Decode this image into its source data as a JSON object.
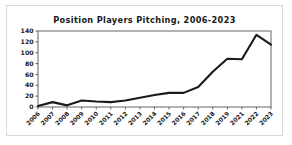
{
  "chart_data": {
    "type": "line",
    "title": "Position Players Pitching, 2006-2023",
    "xlabel": "",
    "ylabel": "",
    "categories": [
      "2006",
      "2007",
      "2008",
      "2009",
      "2010",
      "2011",
      "2012",
      "2013",
      "2014",
      "2015",
      "2016",
      "2017",
      "2018",
      "2019",
      "2021",
      "2022",
      "2023"
    ],
    "values": [
      2,
      9,
      3,
      12,
      10,
      9,
      12,
      17,
      22,
      26,
      26,
      37,
      65,
      89,
      88,
      133,
      115
    ],
    "series": [
      {
        "name": "Position Players Pitching",
        "values": [
          2,
          9,
          3,
          12,
          10,
          9,
          12,
          17,
          22,
          26,
          26,
          37,
          65,
          89,
          88,
          133,
          115
        ]
      }
    ],
    "ylim": [
      0,
      140
    ],
    "yticks": [
      0,
      20,
      40,
      60,
      80,
      100,
      120,
      140
    ],
    "ytick_labels": [
      "0",
      "20",
      "40",
      "60",
      "80",
      "100",
      "120",
      "140"
    ],
    "xtick_labels": [
      "2006",
      "2007",
      "2008",
      "2009",
      "2010",
      "2011",
      "2012",
      "2013",
      "2014",
      "2015",
      "2016",
      "2017",
      "2018",
      "2019",
      "2021",
      "2022",
      "2023"
    ],
    "xtick_rotation": -45,
    "grid": false,
    "legend": false,
    "line_color": "#1a1a1a",
    "axis_color": "#555555",
    "background_color": "#ffffff",
    "border_color": "#d8d8d8"
  }
}
